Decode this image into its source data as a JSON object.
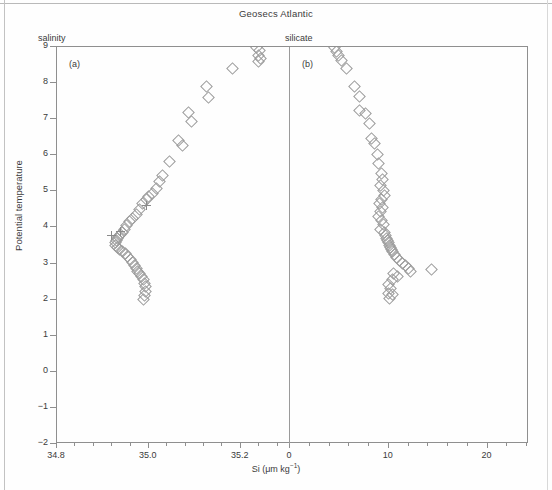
{
  "figure": {
    "title": "Geosecs Atlantic",
    "xlabel_prefix": "Si (μm kg",
    "xlabel_sup": "−1",
    "xlabel_suffix": ")",
    "ylabel": "Potential temperature"
  },
  "panels": {
    "a": {
      "tag": "(a)",
      "head": "salinity"
    },
    "b": {
      "tag": "(b)",
      "head": "silicate"
    }
  },
  "axes": {
    "y_ticks": [
      "9",
      "8",
      "7",
      "6",
      "5",
      "4",
      "3",
      "2",
      "1",
      "0",
      "−1",
      "−2"
    ],
    "x_ticks_a": [
      "34.8",
      "35.0",
      "35.2"
    ],
    "x_ticks_b": [
      "0",
      "10",
      "20"
    ]
  },
  "chart_data": {
    "type": "scatter",
    "title": "Geosecs Atlantic",
    "ylabel": "Potential temperature",
    "xlabel": "Si (μm kg⁻¹)",
    "ylim": [
      -2,
      9
    ],
    "grid": false,
    "legend": null,
    "panels": [
      {
        "id": "a",
        "tag": "(a)",
        "header": "salinity",
        "xlabel": "salinity",
        "xlim": [
          34.8,
          35.305
        ],
        "x_tick_values": [
          34.8,
          35.0,
          35.2
        ],
        "series": [
          {
            "name": "salinity-diamonds",
            "marker": "diamond",
            "color": "#9b9b9b",
            "points": [
              [
                35.232,
                9.02
              ],
              [
                35.238,
                8.93
              ],
              [
                35.236,
                8.78
              ],
              [
                35.24,
                8.72
              ],
              [
                35.236,
                8.63
              ],
              [
                35.18,
                8.42
              ],
              [
                35.123,
                7.92
              ],
              [
                35.127,
                7.63
              ],
              [
                35.083,
                7.22
              ],
              [
                35.09,
                6.97
              ],
              [
                35.062,
                6.43
              ],
              [
                35.072,
                6.3
              ],
              [
                35.042,
                5.85
              ],
              [
                35.028,
                5.46
              ],
              [
                35.022,
                5.3
              ],
              [
                35.014,
                5.12
              ],
              [
                35.006,
                4.97
              ],
              [
                34.998,
                4.88
              ],
              [
                34.992,
                4.8
              ],
              [
                34.985,
                4.68
              ],
              [
                34.978,
                4.52
              ],
              [
                34.97,
                4.4
              ],
              [
                34.962,
                4.28
              ],
              [
                34.956,
                4.18
              ],
              [
                34.95,
                4.08
              ],
              [
                34.944,
                3.98
              ],
              [
                34.94,
                3.9
              ],
              [
                34.936,
                3.84
              ],
              [
                34.932,
                3.78
              ],
              [
                34.929,
                3.72
              ],
              [
                34.927,
                3.66
              ],
              [
                34.925,
                3.6
              ],
              [
                34.926,
                3.54
              ],
              [
                34.929,
                3.48
              ],
              [
                34.934,
                3.42
              ],
              [
                34.94,
                3.36
              ],
              [
                34.946,
                3.3
              ],
              [
                34.952,
                3.22
              ],
              [
                34.957,
                3.14
              ],
              [
                34.962,
                3.06
              ],
              [
                34.966,
                2.98
              ],
              [
                34.97,
                2.9
              ],
              [
                34.974,
                2.82
              ],
              [
                34.978,
                2.74
              ],
              [
                34.982,
                2.66
              ],
              [
                34.986,
                2.58
              ],
              [
                34.988,
                2.48
              ],
              [
                34.99,
                2.38
              ],
              [
                34.99,
                2.26
              ],
              [
                34.988,
                2.14
              ],
              [
                34.987,
                2.04
              ]
            ]
          },
          {
            "name": "salinity-plus",
            "marker": "plus",
            "color": "#8a8a8a",
            "points": [
              [
                34.995,
                4.6
              ],
              [
                34.938,
                3.88
              ],
              [
                34.918,
                3.78
              ]
            ]
          }
        ]
      },
      {
        "id": "b",
        "tag": "(b)",
        "header": "silicate",
        "xlabel": "silicate",
        "xlim": [
          0,
          24.2
        ],
        "x_tick_values": [
          0,
          10,
          20
        ],
        "series": [
          {
            "name": "silicate-diamonds",
            "marker": "diamond",
            "color": "#9b9b9b",
            "points": [
              [
                4.4,
                9.02
              ],
              [
                4.6,
                8.9
              ],
              [
                4.8,
                8.78
              ],
              [
                5.1,
                8.64
              ],
              [
                5.6,
                8.42
              ],
              [
                6.4,
                7.92
              ],
              [
                6.9,
                7.65
              ],
              [
                6.9,
                7.28
              ],
              [
                7.5,
                7.18
              ],
              [
                7.9,
                6.9
              ],
              [
                8.2,
                6.48
              ],
              [
                8.5,
                6.36
              ],
              [
                8.8,
                6.05
              ],
              [
                8.9,
                5.8
              ],
              [
                9.2,
                5.52
              ],
              [
                9.3,
                5.35
              ],
              [
                9.1,
                5.18
              ],
              [
                9.4,
                5.05
              ],
              [
                9.5,
                4.92
              ],
              [
                9.2,
                4.8
              ],
              [
                9.0,
                4.68
              ],
              [
                9.3,
                4.58
              ],
              [
                9.1,
                4.46
              ],
              [
                8.9,
                4.34
              ],
              [
                9.2,
                4.22
              ],
              [
                9.4,
                4.1
              ],
              [
                9.1,
                3.98
              ],
              [
                9.5,
                3.88
              ],
              [
                9.6,
                3.8
              ],
              [
                9.7,
                3.73
              ],
              [
                9.8,
                3.66
              ],
              [
                9.9,
                3.6
              ],
              [
                10.0,
                3.54
              ],
              [
                10.1,
                3.48
              ],
              [
                10.2,
                3.42
              ],
              [
                10.3,
                3.36
              ],
              [
                10.5,
                3.28
              ],
              [
                10.7,
                3.2
              ],
              [
                11.0,
                3.12
              ],
              [
                11.3,
                3.04
              ],
              [
                11.6,
                2.96
              ],
              [
                11.9,
                2.88
              ],
              [
                12.1,
                2.82
              ],
              [
                10.4,
                2.74
              ],
              [
                10.8,
                2.66
              ],
              [
                10.3,
                2.58
              ],
              [
                9.9,
                2.44
              ],
              [
                10.1,
                2.34
              ],
              [
                9.9,
                2.2
              ],
              [
                10.3,
                2.18
              ],
              [
                10.0,
                2.06
              ],
              [
                14.2,
                2.86
              ]
            ]
          }
        ]
      }
    ]
  }
}
